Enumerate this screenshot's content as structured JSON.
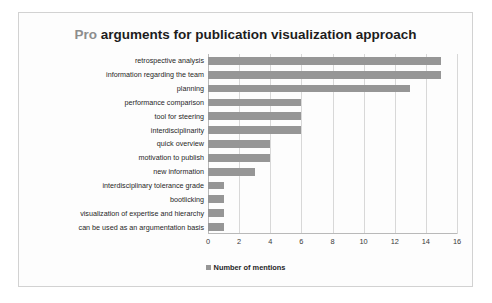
{
  "chart_data": {
    "type": "bar",
    "orientation": "horizontal",
    "title": "Pro arguments for publication visualization approach",
    "title_parts": {
      "emphasis": "Pro",
      "rest": "arguments for publication visualization approach"
    },
    "xlabel": "",
    "ylabel": "",
    "xlim": [
      0,
      16
    ],
    "xticks": [
      0,
      2,
      4,
      6,
      8,
      10,
      12,
      14,
      16
    ],
    "xtick_labels": [
      "0",
      "2",
      "4",
      "6",
      "8",
      "10",
      "12",
      "14",
      "16"
    ],
    "grid": "vertical",
    "legend_position": "bottom",
    "legend": [
      "Number of mentions"
    ],
    "series_name": "Number of mentions",
    "bar_color": "#969696",
    "categories": [
      "retrospective analysis",
      "information regarding the team",
      "planning",
      "performance comparison",
      "tool for steering",
      "interdisciplinarity",
      "quick overview",
      "motivation to publish",
      "new information",
      "interdisciplinary tolerance grade",
      "bootlicking",
      "visualization of expertise and hierarchy",
      "can be used as an argumentation basis"
    ],
    "values": [
      15,
      15,
      13,
      6,
      6,
      6,
      4,
      4,
      3,
      1,
      1,
      1,
      1
    ]
  },
  "colors": {
    "bar": "#969696",
    "grid": "#d8d8d8",
    "axis": "#b9b9b9",
    "frame": "#d2d2d2",
    "title_emphasis": "#8d8d8d",
    "title_rest": "#1d1d1d",
    "background": "#fdfdfd"
  }
}
